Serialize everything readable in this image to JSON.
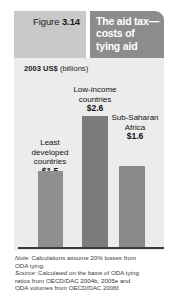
{
  "header": {
    "figure_prefix": "Figure",
    "figure_number": "3.14",
    "title_lines": [
      "The aid tax—",
      "costs of",
      "tying aid"
    ],
    "figure_box_color": "#c9c9c9",
    "title_box_color": "#8c8c8c",
    "title_text_color": "#ffffff"
  },
  "chart_data": {
    "type": "bar",
    "unit_label_bold": "2003 US$",
    "unit_label_regular": "(billions)",
    "unit_label": "2003 US$ (billions)",
    "categories": [
      "Least developed countries",
      "Low-income countries",
      "Sub-Saharan Africa"
    ],
    "category_lines": [
      [
        "Least",
        "developed",
        "countries"
      ],
      [
        "Low-income",
        "countries"
      ],
      [
        "Sub-Saharan",
        "Africa"
      ]
    ],
    "values": [
      1.5,
      2.6,
      1.6
    ],
    "value_labels": [
      "$1.5",
      "$2.6",
      "$1.6"
    ],
    "xlabel": "",
    "ylabel": "2003 US$ (billions)",
    "ylim": [
      0,
      2.6
    ],
    "grid": false,
    "legend": "none",
    "bar_colors": [
      "#8f8f8f",
      "#7b7b7b",
      "#8a8a8a"
    ],
    "panel_background": "#ececed",
    "baseline_color": "#3b3b3b"
  },
  "footnotes": {
    "note_lead": "Note:",
    "note_body_line1": " Calculations assume 20% losses from",
    "note_body_line2": "ODA tying.",
    "source_lead": "Source:",
    "source_body_line1": " Calculated on the basis of ODA tying",
    "source_body_line2": "ratios from OECD/DAC 2004b, 2005e and",
    "source_body_line3": "ODA volumes from OECD/DAC 2006f."
  }
}
